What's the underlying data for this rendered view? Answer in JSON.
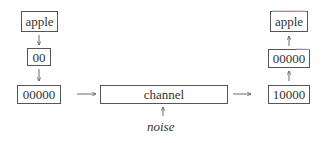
{
  "diagram": {
    "type": "flow",
    "encoder": {
      "source_label": "apple",
      "codeword_label": "00",
      "encoded_label": "00000"
    },
    "channel": {
      "label": "channel",
      "noise_label": "noise"
    },
    "decoder": {
      "received_label": "10000",
      "decoded_codeword_label": "00000",
      "output_label": "apple"
    },
    "edges": [
      {
        "from": "source",
        "to": "codeword",
        "direction": "down"
      },
      {
        "from": "codeword",
        "to": "encoded",
        "direction": "down"
      },
      {
        "from": "encoded",
        "to": "channel",
        "direction": "right"
      },
      {
        "from": "noise",
        "to": "channel",
        "direction": "up"
      },
      {
        "from": "channel",
        "to": "received",
        "direction": "right"
      },
      {
        "from": "received",
        "to": "decoded_codeword",
        "direction": "up"
      },
      {
        "from": "decoded_codeword",
        "to": "output",
        "direction": "up"
      }
    ]
  }
}
